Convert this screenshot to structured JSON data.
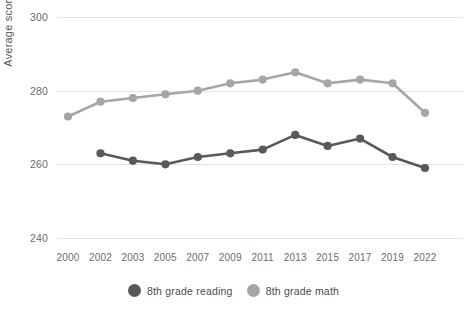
{
  "chart_data": {
    "type": "line",
    "title": "",
    "xlabel": "",
    "ylabel": "Average score",
    "ylim": [
      240,
      300
    ],
    "yticks": [
      240,
      260,
      280,
      300
    ],
    "grid": true,
    "legend_position": "bottom",
    "categories": [
      "2000",
      "2002",
      "2003",
      "2005",
      "2007",
      "2009",
      "2011",
      "2013",
      "2015",
      "2017",
      "2019",
      "2022"
    ],
    "series": [
      {
        "name": "8th grade reading",
        "color": "#595959",
        "values": [
          null,
          263,
          261,
          260,
          262,
          263,
          264,
          268,
          265,
          267,
          262,
          259
        ]
      },
      {
        "name": "8th grade math",
        "color": "#a6a6a6",
        "values": [
          273,
          277,
          278,
          279,
          280,
          282,
          283,
          285,
          282,
          283,
          282,
          274
        ]
      }
    ]
  },
  "axis": {
    "y_title": "Average score",
    "y_ticks": [
      "300",
      "280",
      "260",
      "240"
    ],
    "x_ticks": [
      "2000",
      "2002",
      "2003",
      "2005",
      "2007",
      "2009",
      "2011",
      "2013",
      "2015",
      "2017",
      "2019",
      "2022"
    ]
  },
  "legend": {
    "items": [
      {
        "label": "8th grade reading",
        "color": "#595959"
      },
      {
        "label": "8th grade math",
        "color": "#a6a6a6"
      }
    ]
  },
  "colors": {
    "reading": "#595959",
    "math": "#a6a6a6",
    "grid": "#e3e3e3",
    "text": "#6b6b6b",
    "background": "#ffffff"
  }
}
